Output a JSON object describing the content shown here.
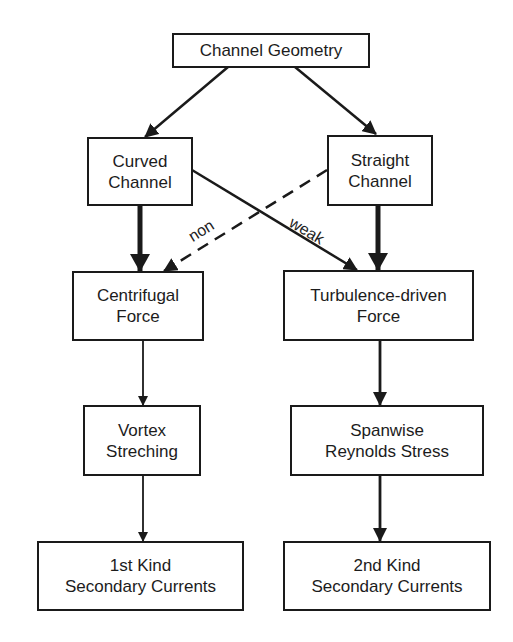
{
  "diagram": {
    "nodes": {
      "channel_geometry": {
        "line1": "Channel Geometry"
      },
      "curved_channel": {
        "line1": "Curved",
        "line2": "Channel"
      },
      "straight_channel": {
        "line1": "Straight",
        "line2": "Channel"
      },
      "centrifugal_force": {
        "line1": "Centrifugal",
        "line2": "Force"
      },
      "turbulence_force": {
        "line1": "Turbulence-driven",
        "line2": "Force"
      },
      "vortex_stretching": {
        "line1": "Vortex",
        "line2": "Streching"
      },
      "spanwise_stress": {
        "line1": "Spanwise",
        "line2": "Reynolds Stress"
      },
      "first_kind": {
        "line1": "1st Kind",
        "line2": "Secondary Currents"
      },
      "second_kind": {
        "line1": "2nd Kind",
        "line2": "Secondary Currents"
      }
    },
    "edge_labels": {
      "non": "non",
      "weak": "weak"
    },
    "edges": [
      {
        "from": "channel_geometry",
        "to": "curved_channel",
        "style": "solid"
      },
      {
        "from": "channel_geometry",
        "to": "straight_channel",
        "style": "solid"
      },
      {
        "from": "curved_channel",
        "to": "centrifugal_force",
        "style": "thick"
      },
      {
        "from": "straight_channel",
        "to": "turbulence_force",
        "style": "thick"
      },
      {
        "from": "curved_channel",
        "to": "turbulence_force",
        "style": "solid",
        "label": "weak"
      },
      {
        "from": "straight_channel",
        "to": "centrifugal_force",
        "style": "dashed",
        "label": "non"
      },
      {
        "from": "centrifugal_force",
        "to": "vortex_stretching",
        "style": "thin"
      },
      {
        "from": "turbulence_force",
        "to": "spanwise_stress",
        "style": "solid"
      },
      {
        "from": "vortex_stretching",
        "to": "first_kind",
        "style": "thin"
      },
      {
        "from": "spanwise_stress",
        "to": "second_kind",
        "style": "solid"
      }
    ]
  }
}
